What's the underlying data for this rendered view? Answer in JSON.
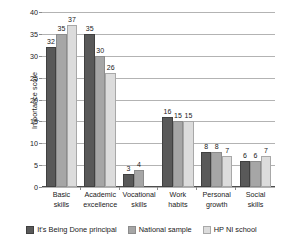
{
  "chart_data": {
    "type": "bar",
    "title": "",
    "xlabel": "",
    "ylabel": "Importance score",
    "ylim": [
      0,
      40
    ],
    "yticks": [
      0,
      5,
      10,
      15,
      20,
      25,
      30,
      35,
      40
    ],
    "ytick_labels": [
      "0",
      "5",
      "10",
      "15",
      "20",
      "25",
      "30",
      "35",
      "40"
    ],
    "grid": true,
    "legend_position": "bottom",
    "categories": [
      "Basic skills",
      "Academic excellence",
      "Vocational skills",
      "Work habits",
      "Personal growth",
      "Social skills"
    ],
    "category_lines": [
      [
        "Basic",
        "skills"
      ],
      [
        "Academic",
        "excellence"
      ],
      [
        "Vocational",
        "skills"
      ],
      [
        "Work",
        "habits"
      ],
      [
        "Personal",
        "growth"
      ],
      [
        "Social",
        "skills"
      ]
    ],
    "series": [
      {
        "name": "It's Being Done principal",
        "color": "#595959",
        "values": [
          32,
          35,
          3,
          16,
          8,
          6
        ],
        "value_labels": [
          "32",
          "35",
          "3",
          "16",
          "8",
          "6"
        ]
      },
      {
        "name": "National sample",
        "color": "#a6a6a6",
        "values": [
          35,
          30,
          4,
          15,
          8,
          6
        ],
        "value_labels": [
          "35",
          "30",
          "4",
          "15",
          "8",
          "6"
        ]
      },
      {
        "name": "HP NI school",
        "color": "#dcdcdc",
        "values": [
          37,
          26,
          0,
          15,
          7,
          7
        ],
        "value_labels": [
          "37",
          "26",
          "",
          "15",
          "7",
          "7"
        ]
      }
    ]
  },
  "legend": {
    "items": [
      {
        "label": "It's Being Done principal"
      },
      {
        "label": "National sample"
      },
      {
        "label": "HP NI school"
      }
    ]
  }
}
